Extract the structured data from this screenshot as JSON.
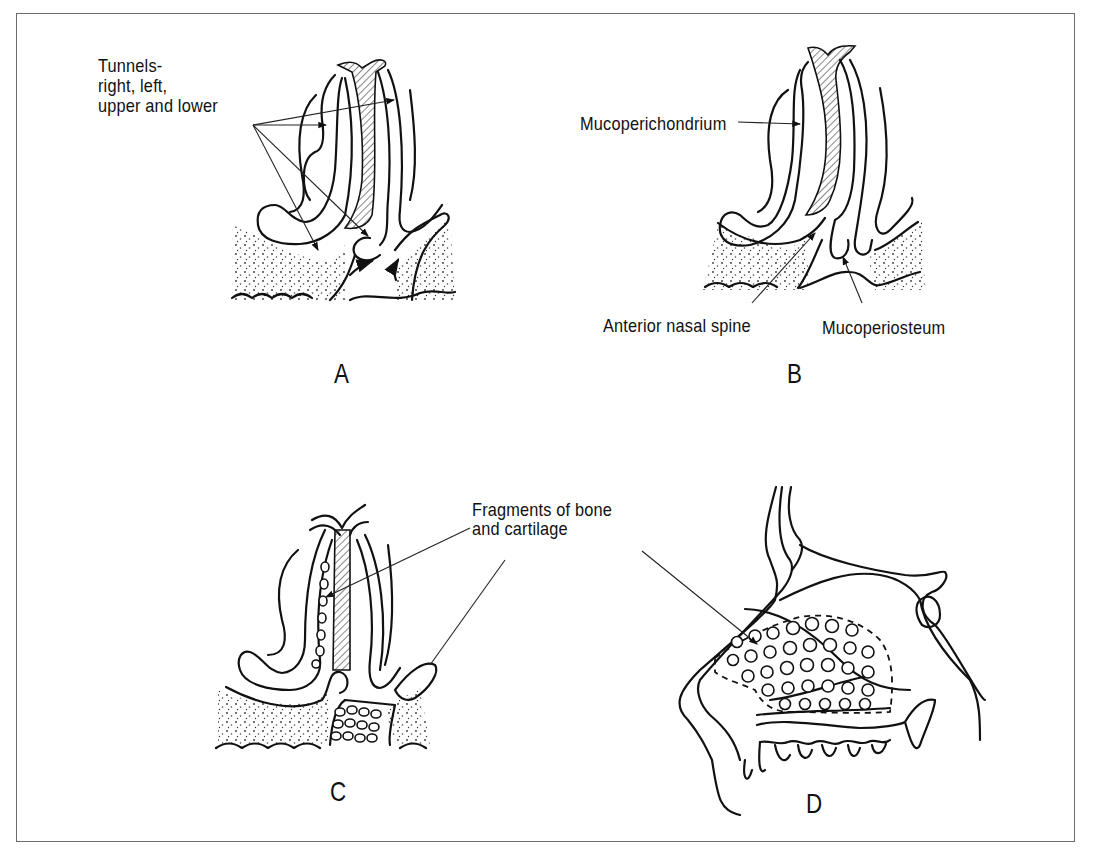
{
  "figure": {
    "panels": [
      {
        "id": "A",
        "letter": "A",
        "labels": {
          "tunnels_line1": "Tunnels-",
          "tunnels_line2": "right, left,",
          "tunnels_line3": "upper and lower"
        }
      },
      {
        "id": "B",
        "letter": "B",
        "labels": {
          "mucoperichondrium": "Mucoperichondrium",
          "anterior_nasal_spine": "Anterior nasal spine",
          "mucoperiosteum": "Mucoperiosteum"
        }
      },
      {
        "id": "C",
        "letter": "C",
        "labels": {
          "fragments_line1": "Fragments of bone",
          "fragments_line2": "and cartilage"
        }
      },
      {
        "id": "D",
        "letter": "D",
        "labels": {}
      }
    ],
    "colors": {
      "line": "#111111",
      "frame": "#6b6b6b",
      "background": "#ffffff"
    }
  }
}
